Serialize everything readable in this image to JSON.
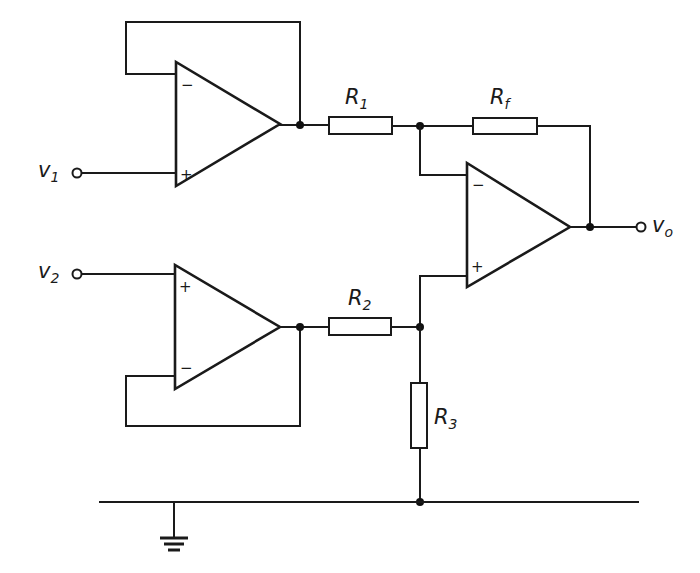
{
  "diagram": {
    "type": "circuit-schematic",
    "labels": {
      "input1": {
        "main": "v",
        "sub": "1"
      },
      "input2": {
        "main": "v",
        "sub": "2"
      },
      "output": {
        "main": "v",
        "sub": "o"
      },
      "r1": {
        "main": "R",
        "sub": "1"
      },
      "r2": {
        "main": "R",
        "sub": "2"
      },
      "r3": {
        "main": "R",
        "sub": "3"
      },
      "rf": {
        "main": "R",
        "sub": "f"
      }
    },
    "opamps": [
      {
        "id": "A1",
        "minus": "−",
        "plus": "+"
      },
      {
        "id": "A2",
        "minus": "−",
        "plus": "+"
      },
      {
        "id": "A3",
        "minus": "−",
        "plus": "+"
      }
    ],
    "colors": {
      "ink": "#1a1a1a",
      "background": "#ffffff"
    }
  }
}
